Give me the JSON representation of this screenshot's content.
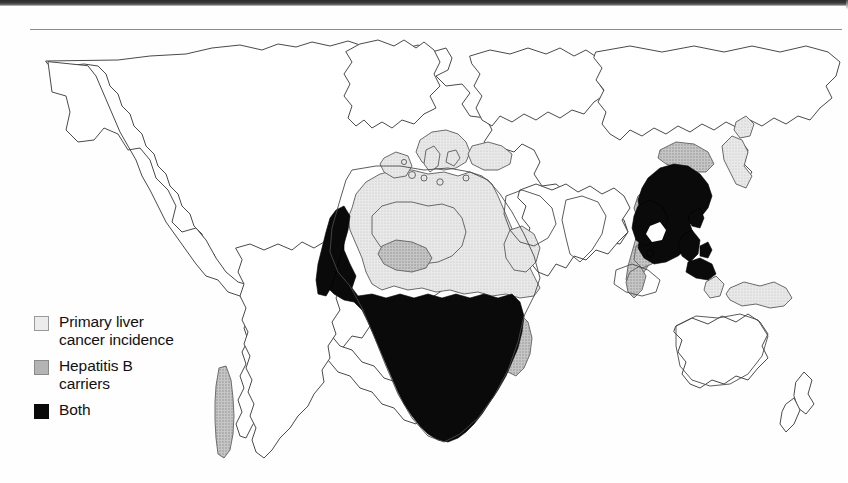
{
  "figure": {
    "kind": "thematic-world-map",
    "projection": "world-outline",
    "background_color": "#ffffff",
    "outline_color": "#4a4a4a"
  },
  "legend": {
    "title": "",
    "items": [
      {
        "id": "primary-liver-cancer",
        "label_line1": "Primary liver",
        "label_line2": "cancer incidence",
        "swatch_style": "light",
        "color": "#ececec",
        "icon": "square-swatch-icon"
      },
      {
        "id": "hepatitis-b-carriers",
        "label_line1": "Hepatitis B",
        "label_line2": "carriers",
        "swatch_style": "mid",
        "color": "#b4b4b4",
        "icon": "square-swatch-icon"
      },
      {
        "id": "both",
        "label_line1": "Both",
        "label_line2": "",
        "swatch_style": "black",
        "color": "#0a0a0a",
        "icon": "square-swatch-icon"
      }
    ]
  },
  "map_regions": {
    "primary_liver_cancer_incidence": [
      "North Africa",
      "Sahel",
      "Horn of Africa",
      "Arabian Peninsula margin",
      "Balkans",
      "Greece",
      "Italy",
      "Iberian margin",
      "Turkey"
    ],
    "hepatitis_b_carriers": [
      "Madagascar",
      "Chile",
      "Papua New Guinea",
      "Japan",
      "Korea",
      "Malay Peninsula",
      "Borneo margin",
      "Central Africa patch"
    ],
    "both": [
      "Sub-Saharan Africa",
      "Southern China",
      "Mainland Southeast Asia",
      "Philippines",
      "Taiwan"
    ],
    "unshaded": [
      "North America",
      "Greenland",
      "Northern Europe",
      "Russia",
      "India",
      "Middle East",
      "Australia",
      "New Zealand",
      "Brazil",
      "Argentina"
    ]
  },
  "colors": {
    "light_gray": "#ececec",
    "mid_gray": "#b4b4b4",
    "black": "#0a0a0a",
    "outline": "#4a4a4a",
    "scan_band": "#2c2c2c"
  }
}
